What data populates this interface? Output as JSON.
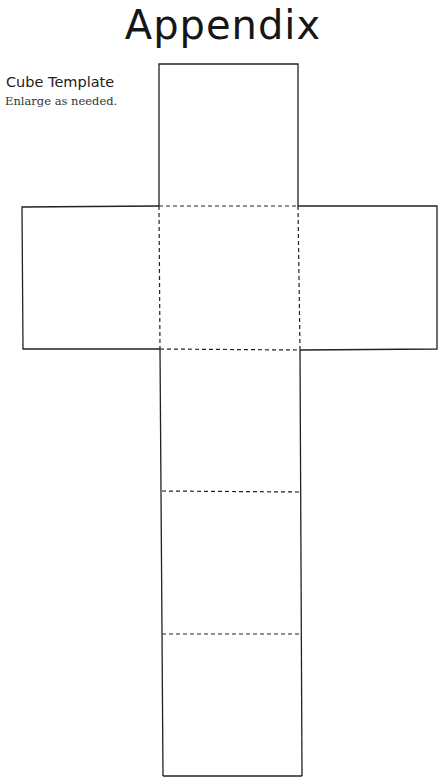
{
  "page": {
    "title": "Appendix",
    "section_title": "Cube Template",
    "instruction": "Enlarge as needed."
  },
  "cube_net": {
    "faces": 6,
    "layout": "cross",
    "line_color": "#222222",
    "fold_line_style": "dashed",
    "cut_line_style": "solid"
  }
}
